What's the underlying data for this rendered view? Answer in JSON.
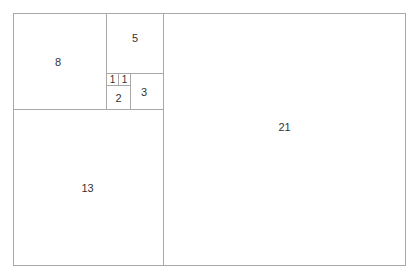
{
  "diagram": {
    "line_color": "#a8a8a8",
    "squares": [
      {
        "label": "8"
      },
      {
        "label": "5"
      },
      {
        "label": "1"
      },
      {
        "label": "1"
      },
      {
        "label": "2"
      },
      {
        "label": "3"
      },
      {
        "label": "13"
      },
      {
        "label": "21"
      }
    ]
  }
}
